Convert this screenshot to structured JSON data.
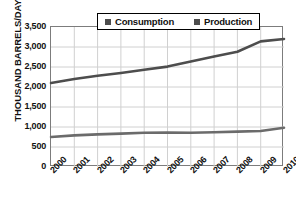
{
  "chart_data": {
    "type": "line",
    "title": "",
    "xlabel": "",
    "ylabel": "THOUSAND BARRELS/DAY",
    "categories": [
      "2000",
      "2001",
      "2002",
      "2003",
      "2004",
      "2005",
      "2006",
      "2007",
      "2008",
      "2009",
      "2010"
    ],
    "ylim": [
      0,
      3500
    ],
    "yticks": [
      "0",
      "500",
      "1,000",
      "1,500",
      "2,000",
      "2,500",
      "3,000",
      "3,500"
    ],
    "ytick_values": [
      0,
      500,
      1000,
      1500,
      2000,
      2500,
      3000,
      3500
    ],
    "grid": true,
    "legend_position": "top-center",
    "series": [
      {
        "name": "Consumption",
        "color": "#4d4d4d",
        "values": [
          2100,
          2200,
          2280,
          2350,
          2430,
          2510,
          2640,
          2760,
          2880,
          3140,
          3200
        ]
      },
      {
        "name": "Production",
        "color": "#6b6b6b",
        "values": [
          750,
          790,
          815,
          835,
          855,
          860,
          855,
          870,
          885,
          900,
          980
        ]
      }
    ]
  },
  "legend": {
    "items": [
      {
        "label": "Consumption",
        "swatch": "legend-swatch-icon"
      },
      {
        "label": "Production",
        "swatch": "legend-swatch-icon"
      }
    ]
  },
  "title_strip": {
    "text": ""
  }
}
